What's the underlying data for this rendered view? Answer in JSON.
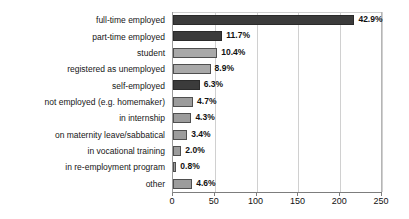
{
  "chart_data": {
    "type": "bar",
    "orientation": "horizontal",
    "title": "",
    "xlabel": "",
    "ylabel": "",
    "xlim": [
      0,
      250
    ],
    "xticks": [
      0,
      50,
      100,
      150,
      200,
      250
    ],
    "grid": true,
    "legend": "none",
    "categories": [
      "full-time employed",
      "part-time employed",
      "student",
      "registered as unemployed",
      "self-employed",
      "not employed (e.g. homemaker)",
      "in internship",
      "on maternity leave/sabbatical",
      "in vocational training",
      "in re-employment program",
      "other"
    ],
    "values": [
      217,
      59,
      53,
      45,
      32,
      24,
      22,
      17,
      10,
      4,
      23
    ],
    "data_labels": [
      "42.9%",
      "11.7%",
      "10.4%",
      "8.9%",
      "6.3%",
      "4.7%",
      "4.3%",
      "3.4%",
      "2.0%",
      "0.8%",
      "4.6%"
    ],
    "percentages": [
      42.9,
      11.7,
      10.4,
      8.9,
      6.3,
      4.7,
      4.3,
      3.4,
      2.0,
      0.8,
      4.6
    ],
    "bar_styles": [
      "dark",
      "dark",
      "light",
      "light",
      "dark",
      "mid",
      "mid",
      "mid",
      "mid",
      "mid",
      "mid"
    ],
    "colors": {
      "dark": "#3b3b3b",
      "light": "#a9a9a9",
      "mid": "#9c9c9c",
      "gridline": "#d0d0d0",
      "axis": "#7d7d7d",
      "text": "#111111"
    }
  }
}
